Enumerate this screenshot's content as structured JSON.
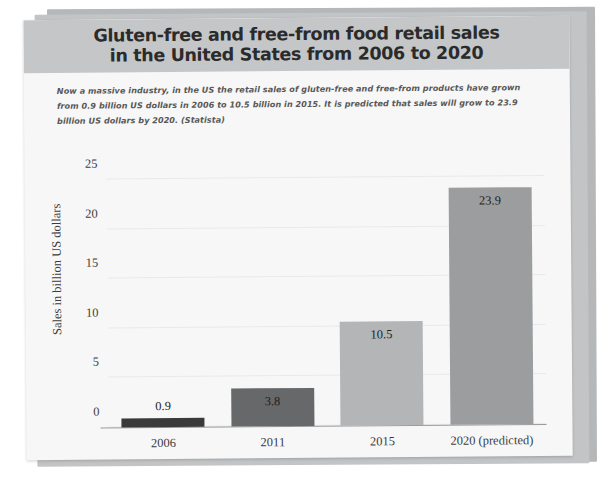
{
  "chart_data": {
    "type": "bar",
    "title": "Gluten-free and free-from food retail sales\nin the United States from 2006 to 2020",
    "subtitle": "Now a massive industry, in the US the retail sales of gluten-free and free-from products have grown from 0.9 billion US dollars in 2006 to 10.5 billion in 2015. It is predicted that sales will grow to 23.9 billion US dollars by 2020. (Statista)",
    "categories": [
      "2006",
      "2011",
      "2015",
      "2020 (predicted)"
    ],
    "values": [
      0.9,
      3.8,
      10.5,
      23.9
    ],
    "value_labels": [
      "0.9",
      "3.8",
      "10.5",
      "23.9"
    ],
    "label_placement": [
      "outside",
      "inside",
      "inside",
      "inside"
    ],
    "bar_colors": [
      "#3a3a3a",
      "#666869",
      "#b3b5b6",
      "#9b9d9e"
    ],
    "xlabel": "",
    "ylabel": "Sales in billion US dollars",
    "ylim": [
      0,
      25
    ],
    "yticks": [
      "0",
      "5",
      "10",
      "15",
      "20",
      "25"
    ],
    "ytick_values": [
      0,
      5,
      10,
      15,
      20,
      25
    ],
    "grid": true,
    "legend": "none",
    "source": "Statista"
  },
  "colors": {
    "card_background": "#f7f7f7",
    "title_band": "#c4c6c8",
    "title_text": "#2b2b2b",
    "subtitle_text": "#585858",
    "axis_text": "#3c3c3c",
    "gridline": "#e9e9e9",
    "sheet_shadow": "#b9bbbd"
  }
}
